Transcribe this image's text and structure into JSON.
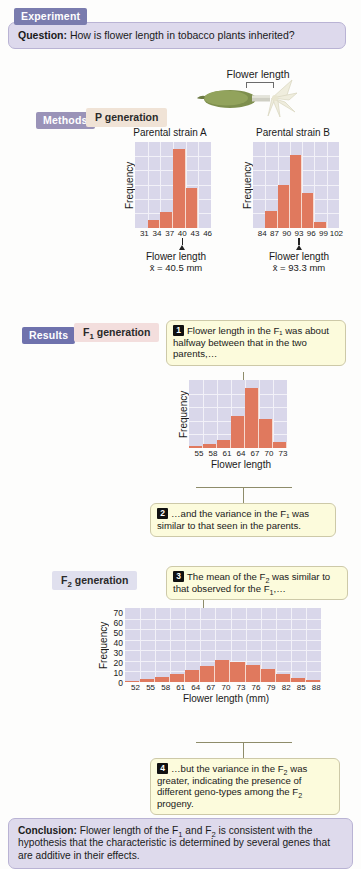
{
  "header": {
    "experiment_tag": "Experiment",
    "question_label": "Question:",
    "question_text": "How is flower length in tobacco plants inherited?"
  },
  "flower": {
    "caption": "Flower length"
  },
  "methods": {
    "tag": "Methods",
    "generation_label": "P generation"
  },
  "results": {
    "tag": "Results",
    "f1_label": "F₁ generation",
    "f2_label": "F₂ generation"
  },
  "callouts": [
    {
      "number": "1",
      "text": "Flower length in the F₁ was about halfway between that in the two parents,…"
    },
    {
      "number": "2",
      "text": "…and the variance in the F₁ was similar to that seen in the parents."
    },
    {
      "number": "3",
      "text": "The mean of the F₂ was similar to that  observed for the F₁,…"
    },
    {
      "number": "4",
      "text": "…but the variance in the F₂ was greater, indicating the presence of different geno-types among the F₂ progeny."
    }
  ],
  "conclusion": {
    "label": "Conclusion:",
    "text": "Flower length of the F₁ and F₂ is consistent with the hypothesis that the characteristic is determined by several genes that are additive in their effects."
  },
  "chart_data": [
    {
      "type": "bar",
      "id": "parental-strain-a",
      "title": "Parental strain A",
      "xlabel": "Flower length",
      "ylabel": "Frequency",
      "mean_text": "x̄ = 40.5 mm",
      "mean_value": 40.5,
      "categories": [
        "31",
        "34",
        "37",
        "40",
        "43",
        "46"
      ],
      "values": [
        0,
        6,
        13,
        66,
        33,
        0
      ],
      "ylim": [
        0,
        72
      ],
      "grid": true
    },
    {
      "type": "bar",
      "id": "parental-strain-b",
      "title": "Parental strain B",
      "xlabel": "Flower length",
      "ylabel": "Frequency",
      "mean_text": "x̄ = 93.3 mm",
      "mean_value": 93.3,
      "categories": [
        "84",
        "87",
        "90",
        "93",
        "96",
        "99",
        "102"
      ],
      "values": [
        0,
        14,
        36,
        61,
        29,
        5,
        0
      ],
      "ylim": [
        0,
        72
      ],
      "grid": true
    },
    {
      "type": "bar",
      "id": "f1-generation",
      "title": "",
      "xlabel": "Flower length",
      "ylabel": "Frequency",
      "categories": [
        "55",
        "58",
        "61",
        "64",
        "67",
        "70",
        "73"
      ],
      "values": [
        2,
        4,
        9,
        34,
        64,
        31,
        6
      ],
      "ylim": [
        0,
        72
      ],
      "grid": true
    },
    {
      "type": "bar",
      "id": "f2-generation",
      "title": "",
      "xlabel": "Flower length (mm)",
      "ylabel": "Frequency",
      "categories": [
        "52",
        "55",
        "58",
        "61",
        "64",
        "67",
        "70",
        "73",
        "76",
        "79",
        "82",
        "85",
        "88"
      ],
      "values": [
        1,
        3,
        5,
        8,
        11,
        15,
        21,
        19,
        16,
        12,
        8,
        4,
        2
      ],
      "yticks": [
        "70",
        "60",
        "50",
        "40",
        "30",
        "20",
        "10",
        "0"
      ],
      "ylim": [
        0,
        70
      ],
      "grid": true
    }
  ]
}
